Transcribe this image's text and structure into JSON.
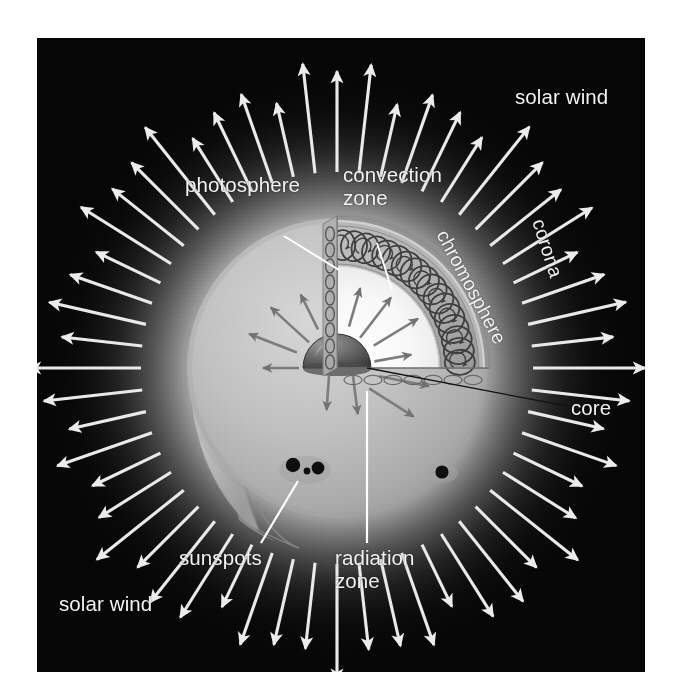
{
  "figure": {
    "background_color": "#ffffff",
    "panel_color": "#050505",
    "label_color": "#f2f2f2",
    "leader_line_color_light": "#ffffff",
    "leader_line_color_dark": "#111111"
  },
  "labels": {
    "solar_wind_top": "solar wind",
    "solar_wind_bottom": "solar wind",
    "photosphere": "photosphere",
    "convection_zone_line1": "convection",
    "convection_zone_line2": "zone",
    "chromosphere": "chromosphere",
    "corona": "corona",
    "core": "core",
    "sunspots": "sunspots",
    "radiation_zone_line1": "radiation",
    "radiation_zone_line2": "zone"
  },
  "diagram": {
    "type": "labelled-cutaway-illustration",
    "sun_disk": {
      "center_x": 300,
      "center_y": 330,
      "radius": 150,
      "surface_color": "#b9b9b9"
    },
    "corona_glow": {
      "inner_radius": 150,
      "outer_radius": 300,
      "color": "#e8e8e8"
    },
    "solar_wind_arrows": {
      "count": 56,
      "inner_radius": 196,
      "outer_radius": 288,
      "color": "#e9e9e9",
      "description": "white arrows radiating outward all around the disk"
    },
    "cutaway_wedge": {
      "description": "quarter wedge cut from the upper-right of the disk showing interior layers",
      "layers": [
        {
          "name": "photosphere",
          "order": 1,
          "note": "thin outer skin of the wedge"
        },
        {
          "name": "chromosphere",
          "order": 2,
          "note": "labelled on the outside of the wedge, curved text"
        },
        {
          "name": "convection zone",
          "order": 3,
          "cells": 17,
          "note": "ring of small circulation circles"
        },
        {
          "name": "radiation zone",
          "order": 4,
          "note": "bright interior with straight radiating arrows"
        },
        {
          "name": "core",
          "order": 5,
          "note": "dark hemisphere at the wedge apex"
        }
      ]
    },
    "radiation_arrows": {
      "count": 11,
      "color": "#7a7a7a"
    },
    "sunspot_groups": [
      {
        "name": "left-group",
        "spots": 3,
        "cx": 268,
        "cy": 432
      },
      {
        "name": "right-spot",
        "spots": 1,
        "cx": 405,
        "cy": 435
      }
    ]
  }
}
